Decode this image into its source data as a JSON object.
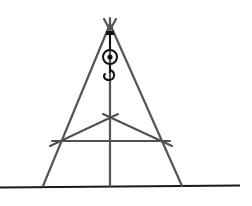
{
  "diagram": {
    "type": "tripod-with-hook",
    "colors": {
      "background": "#ffffff",
      "legs": "#555555",
      "braces": "#505050",
      "ground": "#1a1a1a",
      "hook": "#111111"
    },
    "components": [
      {
        "id": "left-leg",
        "from": [
          110,
          22
        ],
        "to": [
          43,
          186
        ]
      },
      {
        "id": "center-leg",
        "from": [
          110,
          22
        ],
        "to": [
          110,
          186
        ]
      },
      {
        "id": "right-leg",
        "from": [
          110,
          22
        ],
        "to": [
          182,
          186
        ]
      },
      {
        "id": "horizontal-brace",
        "from": [
          52,
          141
        ],
        "to": [
          170,
          141
        ]
      },
      {
        "id": "left-diagonal-brace",
        "from": [
          50,
          146
        ],
        "to": [
          118,
          115
        ]
      },
      {
        "id": "right-diagonal-brace",
        "from": [
          104,
          115
        ],
        "to": [
          172,
          146
        ]
      },
      {
        "id": "ground-line",
        "from": [
          0,
          187
        ],
        "to": [
          240,
          185
        ]
      },
      {
        "id": "hook-assembly",
        "center": [
          110,
          58
        ]
      }
    ],
    "labels": []
  }
}
